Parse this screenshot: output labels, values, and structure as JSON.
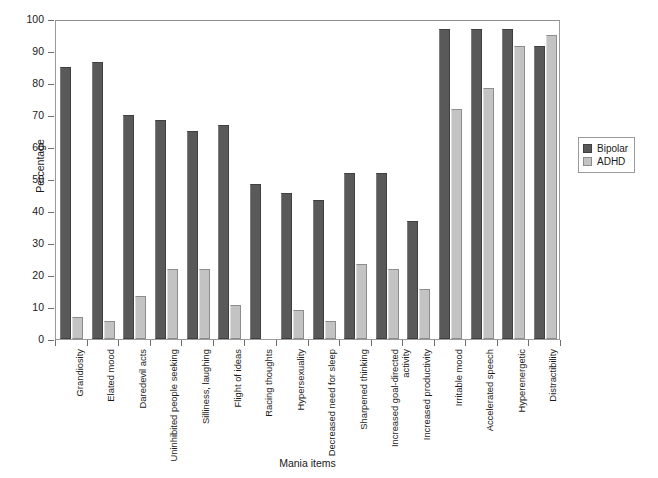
{
  "chart_data": {
    "type": "bar",
    "title": "",
    "xlabel": "Mania items",
    "ylabel": "Percentage",
    "ylim": [
      0,
      100
    ],
    "yticks": [
      0,
      10,
      20,
      30,
      40,
      50,
      60,
      70,
      80,
      90,
      100
    ],
    "grid": false,
    "legend_position": "right",
    "categories": [
      "Grandiosity",
      "Elated mood",
      "Daredevil acts",
      "Uninhibited people seeking",
      "Silliness, laughing",
      "Flight of ideas",
      "Racing thoughts",
      "Hypersexuality",
      "Decreased need for sleep",
      "Sharpened thinking",
      "Increased goal-directed activity",
      "Increased productivity",
      "Irritable mood",
      "Accelerated speech",
      "Hyperenergetic",
      "Distractibility"
    ],
    "series": [
      {
        "name": "Bipolar",
        "color": "#595959",
        "values": [
          85,
          86.5,
          70,
          68.5,
          65,
          67,
          48.5,
          45.5,
          43.5,
          52,
          52,
          37,
          97,
          97,
          97,
          91.5
        ]
      },
      {
        "name": "ADHD",
        "color": "#c3c3c3",
        "values": [
          7,
          5.5,
          13.5,
          22,
          22,
          10.5,
          0,
          9,
          5.5,
          23.5,
          22,
          15.5,
          72,
          78.5,
          91.5,
          95
        ]
      }
    ]
  },
  "legend": {
    "entries": [
      {
        "label": "Bipolar",
        "swatch": "bipolar"
      },
      {
        "label": "ADHD",
        "swatch": "adhd"
      }
    ]
  }
}
